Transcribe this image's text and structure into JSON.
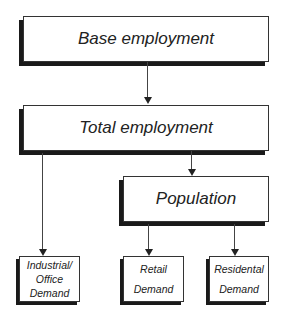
{
  "diagram": {
    "nodes": {
      "base_employment": "Base employment",
      "total_employment": "Total employment",
      "population": "Population",
      "industrial_office_demand": [
        "Industrial/",
        "Office",
        "Demand"
      ],
      "retail_demand": [
        "Retail",
        "Demand"
      ],
      "residential_demand": [
        "Residental",
        "Demand"
      ]
    },
    "edges": [
      {
        "from": "Base employment",
        "to": "Total employment"
      },
      {
        "from": "Total employment",
        "to": "Industrial/Office Demand"
      },
      {
        "from": "Total employment",
        "to": "Population"
      },
      {
        "from": "Population",
        "to": "Retail Demand"
      },
      {
        "from": "Population",
        "to": "Residental Demand"
      }
    ]
  }
}
